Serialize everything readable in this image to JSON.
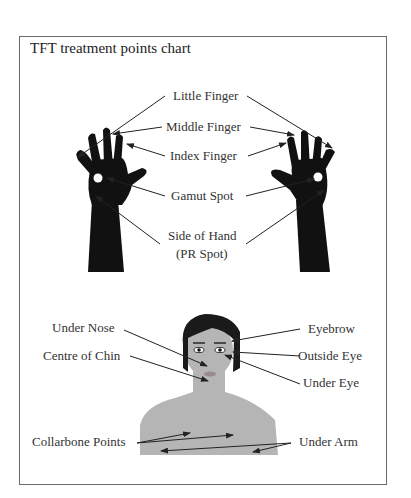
{
  "title": "TFT treatment points chart",
  "hands": {
    "labels": {
      "little_finger": "Little Finger",
      "middle_finger": "Middle Finger",
      "index_finger": "Index Finger",
      "gamut_spot": "Gamut Spot",
      "side_of_hand_line1": "Side of Hand",
      "side_of_hand_line2": "(PR Spot)"
    }
  },
  "face": {
    "labels": {
      "under_nose": "Under Nose",
      "centre_of_chin": "Centre of Chin",
      "collarbone_points": "Collarbone Points",
      "eyebrow": "Eyebrow",
      "outside_eye": "Outside Eye",
      "under_eye": "Under Eye",
      "under_arm": "Under Arm"
    }
  },
  "colors": {
    "hand": "#111111",
    "skin": "#b5b5b5",
    "hair": "#1a1a1a",
    "lips": "#9a8a8a",
    "frame": "#6a6a6a"
  }
}
